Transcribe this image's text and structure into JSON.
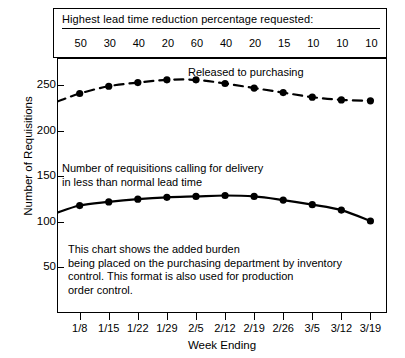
{
  "header": {
    "title": "Highest lead time reduction percentage requested:",
    "values": [
      "50",
      "30",
      "40",
      "20",
      "60",
      "40",
      "20",
      "15",
      "10",
      "10",
      "10"
    ]
  },
  "annotations": {
    "released": "Released to purchasing",
    "requisitions_line1": "Number of requisitions calling for delivery",
    "requisitions_line2": "in less than normal lead time",
    "note_line1": "This chart shows the added burden",
    "note_line2": "being placed on the purchasing department by inventory",
    "note_line3": "control.  This format is also used for production",
    "note_line4": "order control."
  },
  "chart_data": {
    "type": "line",
    "title": "",
    "xlabel": "Week Ending",
    "ylabel": "Number of Requisitions",
    "categories": [
      "1/8",
      "1/15",
      "1/22",
      "1/29",
      "2/5",
      "2/12",
      "2/19",
      "2/26",
      "3/5",
      "3/12",
      "3/19"
    ],
    "ylim": [
      0,
      280
    ],
    "yticks": [
      50,
      100,
      150,
      200,
      250
    ],
    "grid": false,
    "legend": "inline-annotations",
    "origin_value_top": 232,
    "origin_value_bottom": 110,
    "series": [
      {
        "name": "Released to purchasing",
        "style": "dashed",
        "marker": "circle",
        "values": [
          241,
          249,
          253,
          256,
          256,
          252,
          247,
          242,
          237,
          234,
          233
        ]
      },
      {
        "name": "Number of requisitions calling for delivery in less than normal lead time",
        "style": "solid",
        "marker": "circle",
        "values": [
          118,
          122,
          125,
          127,
          128,
          129,
          128,
          124,
          119,
          113,
          101
        ]
      }
    ]
  }
}
